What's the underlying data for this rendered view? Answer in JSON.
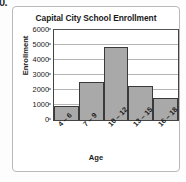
{
  "question_number": "0.",
  "chart_data": {
    "type": "bar",
    "title": "Capital City School Enrollment",
    "xlabel": "Age",
    "ylabel": "Enrollment",
    "categories": [
      "4 – 6",
      "7 – 9",
      "10 – 12",
      "13 – 15",
      "16 – 18"
    ],
    "values": [
      950,
      2550,
      4850,
      2250,
      1500
    ],
    "ylim": [
      0,
      6000
    ],
    "ytick_labels": [
      "0",
      "1000",
      "2000",
      "3000",
      "4000",
      "5000",
      "6000"
    ],
    "yticks": [
      0,
      1000,
      2000,
      3000,
      4000,
      5000,
      6000
    ],
    "grid": true,
    "legend": false,
    "colors": {
      "bar_fill": "#a9a9a9",
      "bar_border": "#3a3a3a",
      "gridline": "#b5b5b5",
      "axis": "#444444",
      "text": "#1a1a1a",
      "panel_border": "#b9b9b9",
      "background": "#ffffff"
    }
  }
}
